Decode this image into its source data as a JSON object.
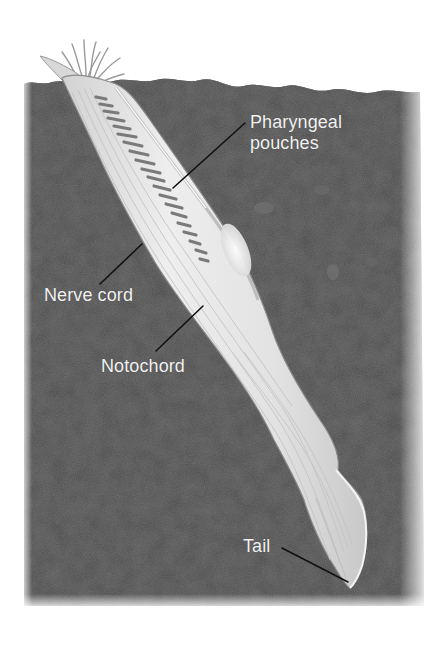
{
  "figure": {
    "colors": {
      "background": "#ffffff",
      "soil": "#555555",
      "soil_dark": "#3f3f3f",
      "body": "#e4e4e4",
      "body_highlight": "#f6f6f6",
      "pouch": "#7a7a7a",
      "leader_line": "#111111",
      "label_text": "#f2f2f2"
    }
  },
  "labels": [
    {
      "id": "pharyngeal-pouches",
      "lines": [
        "Pharyngeal",
        "pouches"
      ]
    },
    {
      "id": "nerve-cord",
      "lines": [
        "Nerve cord"
      ]
    },
    {
      "id": "notochord",
      "lines": [
        "Notochord"
      ]
    },
    {
      "id": "tail",
      "lines": [
        "Tail"
      ]
    }
  ]
}
